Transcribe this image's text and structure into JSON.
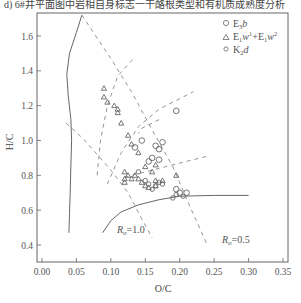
{
  "caption": "d) 6#井平面图中岩相自身标志一干酪根类型和有机质成熟度分析",
  "chart_data": {
    "type": "scatter",
    "title": "",
    "xlabel": "O/C",
    "ylabel": "H/C",
    "xlim": [
      0.0,
      0.35
    ],
    "ylim": [
      0.3,
      1.75
    ],
    "xticks": [
      "0.00",
      "0.05",
      "0.10",
      "0.15",
      "0.20",
      "0.25",
      "0.30",
      "0.35"
    ],
    "xtick_values": [
      0.0,
      0.05,
      0.1,
      0.15,
      0.2,
      0.25,
      0.3,
      0.35
    ],
    "yticks": [
      "0.4",
      "0.6",
      "0.8",
      "1.0",
      "1.2",
      "1.4",
      "1.6"
    ],
    "ytick_values": [
      0.4,
      0.6,
      0.8,
      1.0,
      1.2,
      1.4,
      1.6
    ],
    "grid": false,
    "legend_position": "top-right",
    "series": [
      {
        "name": "E₃b",
        "legend_main": "E",
        "legend_sub": "3",
        "legend_tail": "b",
        "marker": "circle-large",
        "points": [
          [
            0.195,
            1.17
          ],
          [
            0.145,
            1.0
          ],
          [
            0.175,
            0.99
          ],
          [
            0.165,
            0.97
          ],
          [
            0.17,
            0.95
          ],
          [
            0.16,
            0.9
          ],
          [
            0.17,
            0.89
          ],
          [
            0.155,
            0.88
          ],
          [
            0.135,
            0.96
          ],
          [
            0.195,
            0.72
          ],
          [
            0.2,
            0.7
          ],
          [
            0.21,
            0.7
          ]
        ]
      },
      {
        "name": "E₁w¹+E₁w²",
        "legend_main": "E",
        "legend_sub1": "1",
        "legend_w": "w",
        "legend_sup1": "1",
        "legend_plus": "+E",
        "legend_sub2": "1",
        "legend_w2": "w",
        "legend_sup2": "2",
        "marker": "triangle",
        "points": [
          [
            0.09,
            1.3
          ],
          [
            0.09,
            1.25
          ],
          [
            0.105,
            1.2
          ],
          [
            0.11,
            1.18
          ],
          [
            0.11,
            1.16
          ],
          [
            0.095,
            1.22
          ],
          [
            0.115,
            1.1
          ],
          [
            0.125,
            1.03
          ],
          [
            0.13,
            0.98
          ],
          [
            0.14,
            0.93
          ],
          [
            0.15,
            0.85
          ],
          [
            0.12,
            0.82
          ],
          [
            0.125,
            0.8
          ],
          [
            0.12,
            0.78
          ],
          [
            0.13,
            0.78
          ],
          [
            0.135,
            0.8
          ],
          [
            0.14,
            0.78
          ],
          [
            0.12,
            0.76
          ],
          [
            0.145,
            0.76
          ],
          [
            0.15,
            0.74
          ],
          [
            0.155,
            0.73
          ],
          [
            0.165,
            0.77
          ],
          [
            0.165,
            0.74
          ],
          [
            0.175,
            0.77
          ],
          [
            0.195,
            0.8
          ],
          [
            0.165,
            0.86
          ],
          [
            0.16,
            0.82
          ]
        ]
      },
      {
        "name": "K₂d",
        "legend_main": "K",
        "legend_sub": "2",
        "legend_tail": "d",
        "marker": "circle-small",
        "points": [
          [
            0.14,
            0.82
          ],
          [
            0.15,
            0.77
          ],
          [
            0.155,
            0.75
          ],
          [
            0.165,
            0.74
          ],
          [
            0.17,
            0.76
          ],
          [
            0.19,
            0.67
          ],
          [
            0.195,
            0.69
          ],
          [
            0.205,
            0.68
          ],
          [
            0.175,
            0.75
          ],
          [
            0.16,
            0.72
          ]
        ]
      }
    ],
    "annotations": [
      {
        "text_main": "R",
        "text_sub": "o",
        "text_tail": "=1.0",
        "at": [
          0.135,
          0.42
        ]
      },
      {
        "text_main": "R",
        "text_sub": "o",
        "text_tail": "=0.5",
        "at": [
          0.205,
          0.38
        ]
      }
    ],
    "curves": {
      "solid_left": [
        [
          0.058,
          1.72
        ],
        [
          0.05,
          1.62
        ],
        [
          0.04,
          1.5
        ],
        [
          0.036,
          1.38
        ],
        [
          0.038,
          1.26
        ],
        [
          0.042,
          1.12
        ],
        [
          0.043,
          1.0
        ],
        [
          0.042,
          0.86
        ],
        [
          0.041,
          0.7
        ],
        [
          0.04,
          0.58
        ],
        [
          0.039,
          0.47
        ]
      ],
      "solid_lower": [
        [
          0.088,
          0.47
        ],
        [
          0.1,
          0.54
        ],
        [
          0.115,
          0.59
        ],
        [
          0.14,
          0.63
        ],
        [
          0.17,
          0.66
        ],
        [
          0.2,
          0.68
        ],
        [
          0.25,
          0.685
        ],
        [
          0.3,
          0.685
        ]
      ],
      "dashed": [
        [
          [
            0.058,
            1.72
          ],
          [
            0.1,
            1.47
          ],
          [
            0.13,
            1.28
          ],
          [
            0.16,
            1.06
          ],
          [
            0.19,
            0.85
          ],
          [
            0.215,
            0.62
          ],
          [
            0.24,
            0.4
          ]
        ],
        [
          [
            0.035,
            1.1
          ],
          [
            0.06,
            1.01
          ],
          [
            0.08,
            0.92
          ],
          [
            0.1,
            0.83
          ],
          [
            0.125,
            0.7
          ],
          [
            0.145,
            0.55
          ],
          [
            0.16,
            0.44
          ]
        ],
        [
          [
            0.08,
            0.8
          ],
          [
            0.085,
            1.0
          ],
          [
            0.095,
            1.2
          ],
          [
            0.11,
            1.37
          ],
          [
            0.135,
            1.48
          ]
        ],
        [
          [
            0.095,
            0.75
          ],
          [
            0.115,
            0.93
          ],
          [
            0.14,
            1.08
          ],
          [
            0.17,
            1.18
          ],
          [
            0.22,
            1.28
          ]
        ],
        [
          [
            0.12,
            0.79
          ],
          [
            0.16,
            0.83
          ],
          [
            0.2,
            0.87
          ],
          [
            0.24,
            0.91
          ]
        ],
        [
          [
            0.17,
            1.12
          ],
          [
            0.145,
            1.07
          ],
          [
            0.14,
            1.04
          ]
        ]
      ]
    }
  }
}
